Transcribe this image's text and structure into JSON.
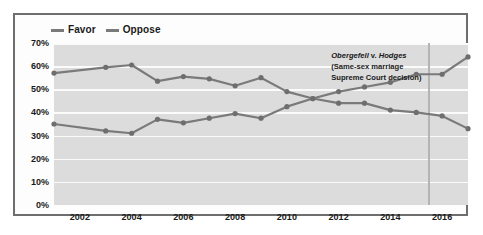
{
  "chart_data": {
    "type": "line",
    "title": "",
    "xlabel": "",
    "ylabel": "",
    "xlim": [
      2001,
      2017
    ],
    "ylim": [
      0,
      70
    ],
    "grid": true,
    "legend_position": "top-left",
    "x": [
      2001,
      2003,
      2004,
      2005,
      2006,
      2007,
      2008,
      2009,
      2010,
      2011,
      2012,
      2013,
      2014,
      2015,
      2016,
      2017
    ],
    "y_tick_labels": [
      "0%",
      "10%",
      "20%",
      "30%",
      "40%",
      "50%",
      "60%",
      "70%"
    ],
    "y_tick_values": [
      0,
      10,
      20,
      30,
      40,
      50,
      60,
      70
    ],
    "x_tick_labels": [
      "2002",
      "2004",
      "2006",
      "2008",
      "2010",
      "2012",
      "2014",
      "2016"
    ],
    "x_tick_values": [
      2002,
      2004,
      2006,
      2008,
      2010,
      2012,
      2014,
      2016
    ],
    "series": [
      {
        "name": "Favor",
        "color": "#7a7a7a",
        "values": [
          35,
          32,
          31,
          37,
          35.5,
          37.5,
          39.5,
          37.5,
          42.5,
          46,
          49,
          51,
          53,
          56.5,
          56.5,
          64
        ]
      },
      {
        "name": "Oppose",
        "color": "#7a7a7a",
        "values": [
          57,
          59.5,
          60.5,
          53.5,
          55.5,
          54.5,
          51.5,
          55,
          49,
          46,
          44,
          44,
          41,
          40,
          38.5,
          33
        ]
      }
    ],
    "annotations": [
      {
        "x": 2015.5,
        "line1_italic": "Obergefell",
        "line1_roman": " v. ",
        "line1_italic2": "Hodges",
        "line2": "(Same-sex marriage",
        "line3": "Supreme Court decision)"
      }
    ]
  },
  "legend": {
    "items": [
      {
        "label": "Favor"
      },
      {
        "label": "Oppose"
      }
    ]
  },
  "colors": {
    "plot_background": "#dcdcdc",
    "gridline": "#fbfbfb",
    "line": "#7a7a7a",
    "marker": "#6e6e6e",
    "event_line": "#b4b4b4",
    "border": "#6e6e6e",
    "text": "#1a1a1a"
  }
}
